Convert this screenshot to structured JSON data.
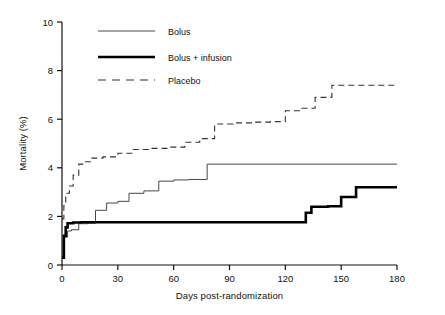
{
  "chart_data": {
    "type": "line",
    "title": "",
    "xlabel": "Days post-randomization",
    "ylabel": "Mortality (%)",
    "xlim": [
      0,
      180
    ],
    "ylim": [
      0,
      10
    ],
    "xticks": [
      0,
      30,
      60,
      90,
      120,
      150,
      180
    ],
    "yticks": [
      0,
      2,
      4,
      6,
      8,
      10
    ],
    "grid": false,
    "legend_position": "top-left",
    "step_shape": "post",
    "series": [
      {
        "name": "Bolus",
        "style": "solid-thin",
        "color": "#333333",
        "x": [
          0,
          1,
          3,
          5,
          9,
          14,
          18,
          24,
          30,
          36,
          44,
          52,
          60,
          68,
          78,
          180
        ],
        "y": [
          0.35,
          1.15,
          1.4,
          1.45,
          1.7,
          1.72,
          2.25,
          2.55,
          2.62,
          2.95,
          3.05,
          3.45,
          3.5,
          3.52,
          4.15,
          4.15
        ]
      },
      {
        "name": "Bolus + infusion",
        "style": "solid-thick",
        "color": "#000000",
        "x": [
          0,
          1,
          2,
          3,
          6,
          10,
          128,
          131,
          134,
          143,
          150,
          158,
          180
        ],
        "y": [
          0.3,
          1.2,
          1.55,
          1.72,
          1.75,
          1.76,
          1.76,
          2.15,
          2.4,
          2.42,
          2.8,
          3.2,
          3.2
        ]
      },
      {
        "name": "Placebo",
        "style": "dashed",
        "color": "#333333",
        "x": [
          0,
          1,
          2,
          4,
          6,
          9,
          12,
          16,
          22,
          30,
          38,
          48,
          58,
          66,
          74,
          82,
          92,
          104,
          112,
          120,
          128,
          136,
          145,
          180
        ],
        "y": [
          1.9,
          2.45,
          2.95,
          3.25,
          3.7,
          4.15,
          4.25,
          4.4,
          4.45,
          4.6,
          4.75,
          4.8,
          4.85,
          5.05,
          5.2,
          5.8,
          5.85,
          5.88,
          5.9,
          6.35,
          6.45,
          6.9,
          7.4,
          7.4
        ]
      }
    ]
  },
  "legend": {
    "items": [
      {
        "label": "Bolus"
      },
      {
        "label": "Bolus + infusion"
      },
      {
        "label": "Placebo"
      }
    ]
  }
}
